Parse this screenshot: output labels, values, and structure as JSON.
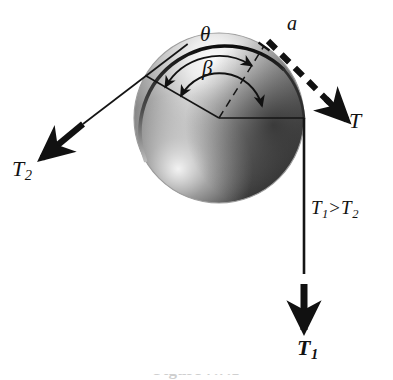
{
  "figure": {
    "caption": "Figure 7.7.1"
  },
  "labels": {
    "tension_right": "T",
    "tension_left": "T",
    "tension_left_sub": "2",
    "tension_down": "T",
    "tension_down_sub": "1",
    "contact_point": "a",
    "angle_theta": "θ",
    "angle_beta": "β",
    "inequality_lhs": "T",
    "inequality_lhs_sub": "1",
    "inequality_rel": ">",
    "inequality_rhs": "T",
    "inequality_rhs_sub": "2"
  },
  "geometry": {
    "circle_center_x": 219,
    "circle_center_y": 118,
    "circle_radius": 85,
    "radius_upper_left_angle_deg": 150,
    "radius_dashed_angle_deg": 58,
    "radius_horizontal_angle_deg": 0,
    "theta_arc_radius": 62,
    "beta_arc_radius": 44,
    "contact_point_x": 264,
    "contact_point_y": 46,
    "vertical_rope_x": 304,
    "vertical_rope_top_y": 118,
    "vertical_rope_bottom_y": 274
  },
  "colors": {
    "background": "#ffffff",
    "ink": "#111111",
    "sphere_dark": "#2a2a2a",
    "sphere_mid": "#8c8c8c",
    "sphere_light": "#f2f2f2",
    "caption_grey": "#cfcfcf"
  }
}
